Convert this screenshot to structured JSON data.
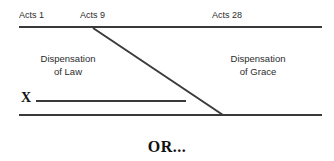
{
  "canvas": {
    "width": 334,
    "height": 161,
    "background": "#ffffff"
  },
  "style": {
    "line_color": "#3a3a3a",
    "text_color": "#2b2b2b",
    "heading_color": "#111111",
    "line_width": 2
  },
  "timeline": {
    "markers": [
      {
        "id": "acts-1",
        "label": "Acts 1",
        "x": 19
      },
      {
        "id": "acts-9",
        "label": "Acts 9",
        "x": 80
      },
      {
        "id": "acts-28",
        "label": "Acts 28",
        "x": 212
      }
    ],
    "top_rule": {
      "x1": 19,
      "y1": 27,
      "x2": 322,
      "y2": 27
    },
    "bottom_rule": {
      "x1": 19,
      "y1": 115,
      "x2": 322,
      "y2": 115
    },
    "divider": {
      "x1": 93,
      "y1": 28,
      "x2": 223,
      "y2": 115
    }
  },
  "regions": {
    "left": {
      "line1": "Dispensation",
      "line2": "of Law"
    },
    "right": {
      "line1": "Dispensation",
      "line2": "of Grace"
    }
  },
  "marker": {
    "x_label": "X",
    "x_rule": {
      "x1": 36,
      "y1": 101,
      "x2": 186,
      "y2": 101
    }
  },
  "caption": {
    "text": "OR..."
  }
}
